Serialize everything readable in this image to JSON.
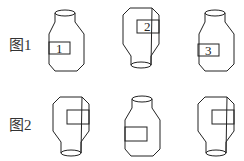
{
  "figure1": {
    "label": "图1",
    "bottles": [
      {
        "id": "bottle-1",
        "orientation": "upright",
        "tag": "1"
      },
      {
        "id": "bottle-2",
        "orientation": "inverted",
        "tag": "2"
      },
      {
        "id": "bottle-3",
        "orientation": "upright",
        "tag": "3"
      }
    ]
  },
  "figure2": {
    "label": "图2",
    "bottles": [
      {
        "id": "bottle-a",
        "orientation": "inverted",
        "tag": ""
      },
      {
        "id": "bottle-b",
        "orientation": "upright",
        "tag": ""
      },
      {
        "id": "bottle-c",
        "orientation": "inverted",
        "tag": ""
      }
    ]
  }
}
